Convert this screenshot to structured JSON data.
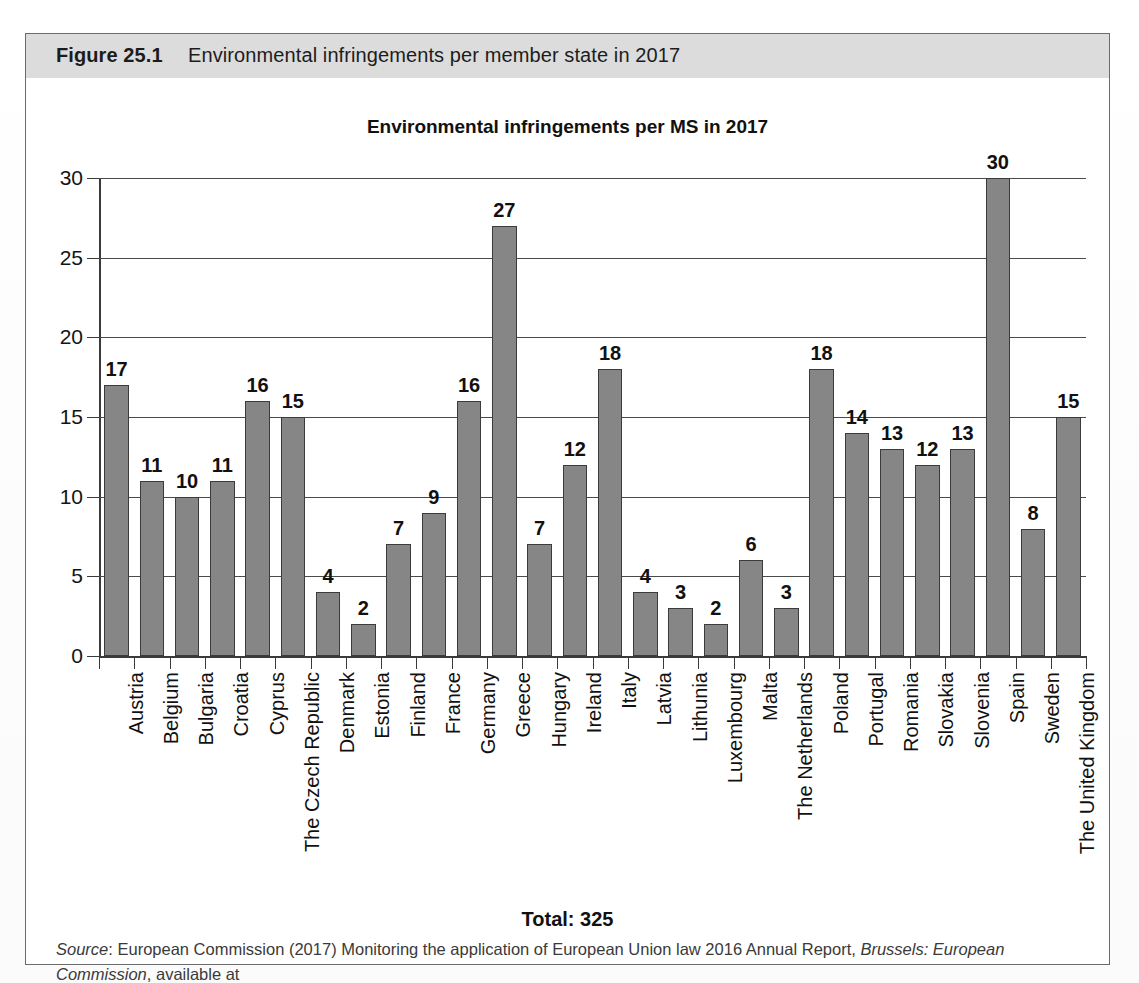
{
  "figure": {
    "label": "Figure 25.1",
    "caption": "Environmental infringements per member state in 2017"
  },
  "total": {
    "text": "Total: 325"
  },
  "source": {
    "prefix": "Source",
    "colon": ": ",
    "part1": "European Commission (2017) Monitoring the application of European Union law 2016 Annual Report, ",
    "italic": "Brussels: European Commission",
    "part2": ", available at",
    "url": "http://eur-lex.europa.eu/legal-content/EN/TXT/PDF/?uri=COM%3A2017%3A370%3AFIN&from=EN"
  },
  "colors": {
    "bar_fill": "#868686",
    "bar_stroke": "#3b3b3b",
    "axis": "#3a3a3a",
    "caption_band": "#dcdcdc",
    "figure_border": "#6b6b6b"
  },
  "chart_data": {
    "type": "bar",
    "title": "Environmental infringements per MS in 2017",
    "xlabel": "",
    "ylabel": "",
    "ylim": [
      0,
      30
    ],
    "yticks": [
      0,
      5,
      10,
      15,
      20,
      25,
      30
    ],
    "grid": true,
    "legend": null,
    "annotation": "Total: 325",
    "data_labels": true,
    "categories": [
      "Austria",
      "Belgium",
      "Bulgaria",
      "Croatia",
      "Cyprus",
      "The Czech Republic",
      "Denmark",
      "Estonia",
      "Finland",
      "France",
      "Germany",
      "Greece",
      "Hungary",
      "Ireland",
      "Italy",
      "Latvia",
      "Lithunia",
      "Luxembourg",
      "Malta",
      "The Netherlands",
      "Poland",
      "Portugal",
      "Romania",
      "Slovakia",
      "Slovenia",
      "Spain",
      "Sweden",
      "The United Kingdom"
    ],
    "values": [
      17,
      11,
      10,
      11,
      16,
      15,
      4,
      2,
      7,
      9,
      16,
      27,
      7,
      12,
      18,
      4,
      3,
      2,
      6,
      3,
      18,
      14,
      13,
      12,
      13,
      30,
      8,
      15
    ]
  }
}
